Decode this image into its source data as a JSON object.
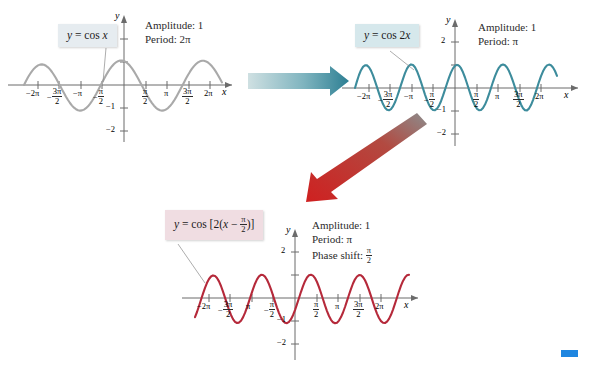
{
  "figure": {
    "background": "#ffffff"
  },
  "panels": [
    {
      "id": "panel-1",
      "equation_label": "y = cos x",
      "equation_plain": "y = cos x",
      "box_color": "#e6ecf0",
      "curve_color": "#a9a9a9",
      "info": {
        "amplitude_label": "Amplitude:",
        "amplitude_value": "1",
        "period_label": "Period:",
        "period_value": "2π"
      },
      "axis": {
        "x_label": "x",
        "y_label": "y",
        "x_ticks": [
          "-2π",
          "-3π/2",
          "-π",
          "-π/2",
          "π/2",
          "π",
          "3π/2",
          "2π"
        ],
        "y_ticks": [
          "2",
          "-1",
          "-2"
        ],
        "x_range": [
          -7.3,
          7.3
        ],
        "y_range": [
          -2.5,
          2.5
        ]
      }
    },
    {
      "id": "panel-2",
      "equation_label": "y = cos 2x",
      "equation_plain": "y = cos 2x",
      "box_color": "#d6e8ec",
      "curve_color": "#3d8c9c",
      "info": {
        "amplitude_label": "Amplitude:",
        "amplitude_value": "1",
        "period_label": "Period:",
        "period_value": "π"
      },
      "axis": {
        "x_label": "x",
        "y_label": "y",
        "x_ticks": [
          "-2π",
          "-3π/2",
          "-π",
          "-π/2",
          "π/2",
          "π",
          "3π/2",
          "2π"
        ],
        "y_ticks": [
          "2",
          "-1",
          "-2"
        ],
        "x_range": [
          -7.3,
          7.3
        ],
        "y_range": [
          -2.5,
          2.5
        ]
      }
    },
    {
      "id": "panel-3",
      "equation_label": "y = cos [2(x − π/2)]",
      "equation_plain": "y = cos [2(x - pi/2)]",
      "box_color": "#f0dde2",
      "curve_color": "#b5293a",
      "info": {
        "amplitude_label": "Amplitude:",
        "amplitude_value": "1",
        "period_label": "Period:",
        "period_value": "π",
        "phase_shift_label": "Phase shift:",
        "phase_shift_value": "π/2"
      },
      "axis": {
        "x_label": "x",
        "y_label": "y",
        "x_ticks": [
          "-2π",
          "-3π/2",
          "-π",
          "-π/2",
          "π/2",
          "π",
          "3π/2",
          "2π"
        ],
        "y_ticks": [
          "2",
          "-1",
          "-2"
        ],
        "x_range": [
          -7.3,
          7.3
        ],
        "y_range": [
          -2.5,
          2.5
        ]
      }
    }
  ],
  "arrows": [
    {
      "id": "arrow-horizontal",
      "direction": "right",
      "color_start": "#cfe0e2",
      "color_end": "#2d7f93",
      "from_panel": "panel-1",
      "to_panel": "panel-2"
    },
    {
      "id": "arrow-diagonal",
      "direction": "down-left",
      "color_start": "#8c8c8c",
      "color_end": "#cf2020",
      "from_panel": "panel-2",
      "to_panel": "panel-3"
    }
  ],
  "marker": {
    "id": "blue-marker",
    "color": "#1f86e0"
  }
}
